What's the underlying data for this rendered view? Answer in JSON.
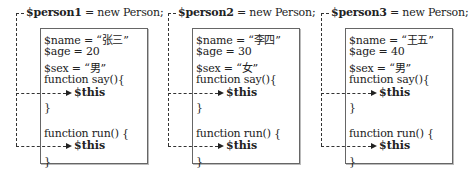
{
  "objects": [
    {
      "declaration_var": "$person1",
      "declaration_rest": " = new Person;",
      "name_line": "$name = “张三”",
      "age_line": "$age =  20",
      "sex_line": "$sex =  “男”",
      "say_open": "function say(){",
      "say_close": "}",
      "run_open": "function run() {",
      "run_close": "}",
      "this_label": "$this"
    },
    {
      "declaration_var": "$person2",
      "declaration_rest": " = new Person;",
      "name_line": "$name = “李四”",
      "age_line": "$age = 30",
      "sex_line": "$sex = “女”",
      "say_open": "function say(){",
      "say_close": "}",
      "run_open": "function run() {",
      "run_close": "}",
      "this_label": "$this"
    },
    {
      "declaration_var": "$person3",
      "declaration_rest": " = new Person;",
      "name_line": "$name = “王五”",
      "age_line": "$age = 40",
      "sex_line": "$sex = “男”",
      "say_open": "function say(){",
      "say_close": "}",
      "run_open": "function run() {",
      "run_close": "}",
      "this_label": "$this"
    }
  ]
}
